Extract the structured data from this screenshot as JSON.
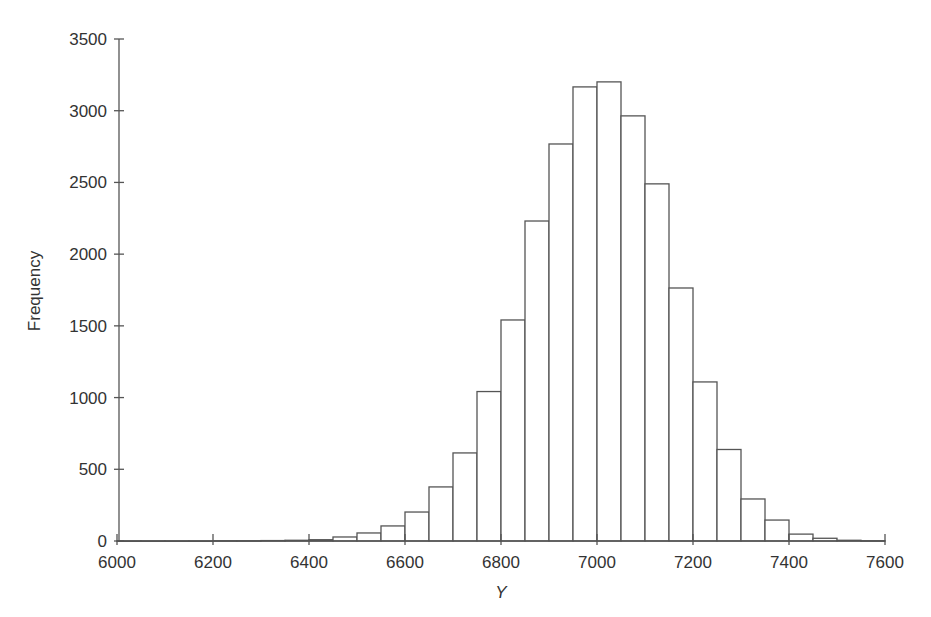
{
  "chart_data": {
    "type": "bar",
    "subtype": "histogram",
    "title": "",
    "xlabel": "Y",
    "ylabel": "Frequency",
    "xlim": [
      6000,
      7600
    ],
    "ylim": [
      0,
      3500
    ],
    "bin_width": 50,
    "grid": false,
    "legend": null,
    "x_ticks": [
      6000,
      6200,
      6400,
      6600,
      6800,
      7000,
      7200,
      7400,
      7600
    ],
    "y_ticks": [
      0,
      500,
      1000,
      1500,
      2000,
      2500,
      3000,
      3500
    ],
    "bins": [
      {
        "start": 6000,
        "end": 6050,
        "count": 1
      },
      {
        "start": 6050,
        "end": 6100,
        "count": 1
      },
      {
        "start": 6100,
        "end": 6150,
        "count": 1
      },
      {
        "start": 6150,
        "end": 6200,
        "count": 1
      },
      {
        "start": 6200,
        "end": 6250,
        "count": 2
      },
      {
        "start": 6250,
        "end": 6300,
        "count": 2
      },
      {
        "start": 6300,
        "end": 6350,
        "count": 3
      },
      {
        "start": 6350,
        "end": 6400,
        "count": 5
      },
      {
        "start": 6400,
        "end": 6450,
        "count": 9
      },
      {
        "start": 6450,
        "end": 6500,
        "count": 28
      },
      {
        "start": 6500,
        "end": 6550,
        "count": 56
      },
      {
        "start": 6550,
        "end": 6600,
        "count": 105
      },
      {
        "start": 6600,
        "end": 6650,
        "count": 202
      },
      {
        "start": 6650,
        "end": 6700,
        "count": 377
      },
      {
        "start": 6700,
        "end": 6750,
        "count": 614
      },
      {
        "start": 6750,
        "end": 6800,
        "count": 1042
      },
      {
        "start": 6800,
        "end": 6850,
        "count": 1541
      },
      {
        "start": 6850,
        "end": 6900,
        "count": 2231
      },
      {
        "start": 6900,
        "end": 6950,
        "count": 2768
      },
      {
        "start": 6950,
        "end": 7000,
        "count": 3166
      },
      {
        "start": 7000,
        "end": 7050,
        "count": 3201
      },
      {
        "start": 7050,
        "end": 7100,
        "count": 2964
      },
      {
        "start": 7100,
        "end": 7150,
        "count": 2490
      },
      {
        "start": 7150,
        "end": 7200,
        "count": 1764
      },
      {
        "start": 7200,
        "end": 7250,
        "count": 1109
      },
      {
        "start": 7250,
        "end": 7300,
        "count": 638
      },
      {
        "start": 7300,
        "end": 7350,
        "count": 293
      },
      {
        "start": 7350,
        "end": 7400,
        "count": 146
      },
      {
        "start": 7400,
        "end": 7450,
        "count": 48
      },
      {
        "start": 7450,
        "end": 7500,
        "count": 19
      },
      {
        "start": 7500,
        "end": 7550,
        "count": 5
      },
      {
        "start": 7550,
        "end": 7600,
        "count": 2
      }
    ]
  },
  "colors": {
    "bar_fill": "#ffffff",
    "bar_stroke": "#555555",
    "axis": "#555555",
    "text": "#333333",
    "background": "#ffffff"
  }
}
